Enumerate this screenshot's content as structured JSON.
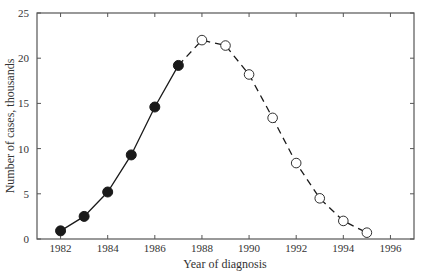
{
  "chart_data": {
    "type": "line",
    "title": "",
    "xlabel": "Year of diagnosis",
    "ylabel": "Number of cases, thousands",
    "xlim": [
      1981,
      1997
    ],
    "ylim": [
      0,
      25
    ],
    "grid": false,
    "legend": null,
    "x_ticks": [
      1982,
      1984,
      1986,
      1988,
      1990,
      1992,
      1994,
      1996
    ],
    "y_ticks": [
      0,
      5,
      10,
      15,
      20,
      25
    ],
    "series": [
      {
        "name": "Observed",
        "style": "solid line, filled circles",
        "x": [
          1982,
          1983,
          1984,
          1985,
          1986,
          1987
        ],
        "values": [
          0.9,
          2.5,
          5.2,
          9.3,
          14.6,
          19.2
        ]
      },
      {
        "name": "Projected",
        "style": "dashed line, open circles",
        "x": [
          1987,
          1988,
          1989,
          1990,
          1991,
          1992,
          1993,
          1994,
          1995
        ],
        "values": [
          19.2,
          22.0,
          21.4,
          18.2,
          13.4,
          8.4,
          4.5,
          2.0,
          0.7
        ]
      }
    ]
  },
  "colors": {
    "line": "#1a1a1a",
    "axis": "#555555",
    "background": "#ffffff"
  }
}
